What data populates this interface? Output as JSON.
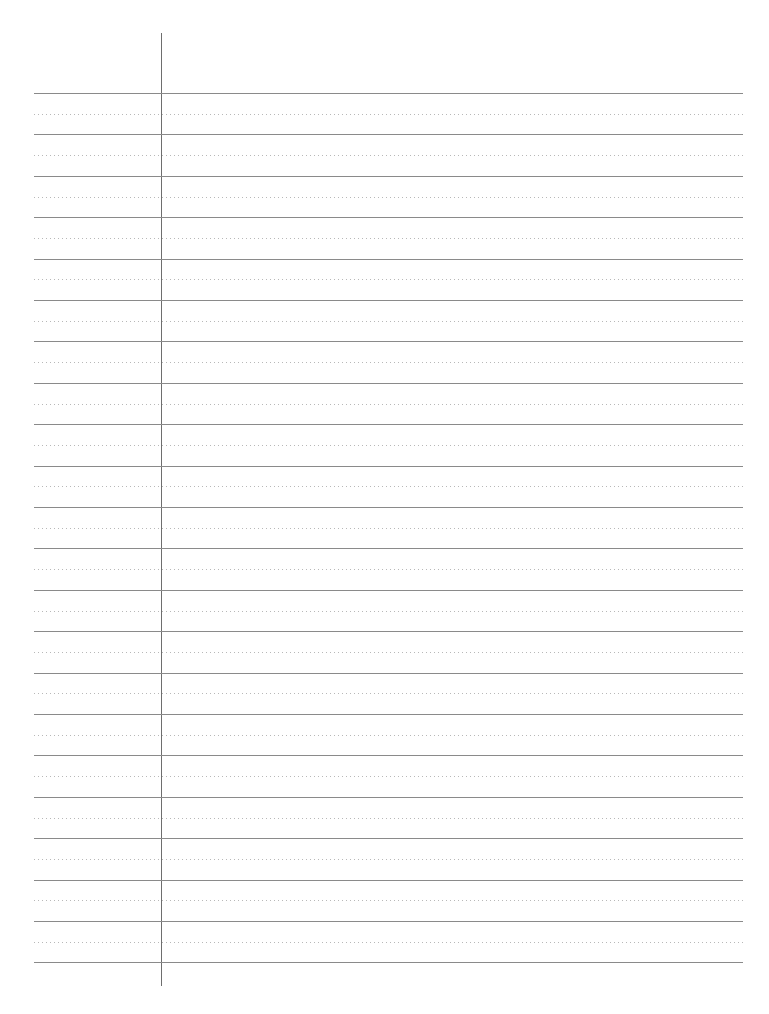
{
  "page": {
    "type": "lined-paper",
    "background_color": "#ffffff",
    "solid_line_color": "#8a8a8a",
    "dotted_line_color": "#b8b8b8",
    "margin_line_color": "#6e6e6e",
    "solid_line_count": 22,
    "dotted_line_count": 21,
    "first_line_y": 93,
    "line_spacing": 41.4
  }
}
